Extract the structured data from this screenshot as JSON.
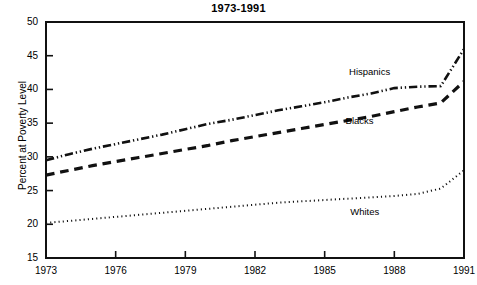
{
  "chart_data": {
    "type": "line",
    "title": "1973-1991",
    "xlabel": "",
    "ylabel": "Percent at Poverty Level",
    "xlim": [
      1973,
      1991
    ],
    "ylim": [
      15,
      50
    ],
    "ytick_step": 5,
    "xtick_step": 3,
    "grid": false,
    "legend_position": "inline-annotations",
    "xticks": [
      "1973",
      "1976",
      "1979",
      "1982",
      "1985",
      "1988",
      "1991"
    ],
    "yticks": [
      "15",
      "20",
      "25",
      "30",
      "35",
      "40",
      "45",
      "50"
    ],
    "x": [
      1973,
      1974,
      1975,
      1976,
      1977,
      1978,
      1979,
      1980,
      1981,
      1982,
      1983,
      1984,
      1985,
      1986,
      1987,
      1988,
      1989,
      1990,
      1991
    ],
    "series": [
      {
        "name": "Hispanics",
        "line_style": "dash-dot-dot",
        "color": "#111111",
        "width": 2.6,
        "label_x": 1986.05,
        "label_y": 42.6,
        "values": [
          29.5,
          30.4,
          31.2,
          31.9,
          32.6,
          33.3,
          34.1,
          34.9,
          35.5,
          36.2,
          36.9,
          37.5,
          38.1,
          38.8,
          39.4,
          40.2,
          40.4,
          40.5,
          46.0
        ]
      },
      {
        "name": "Blacks",
        "line_style": "dash",
        "color": "#111111",
        "width": 3.2,
        "label_x": 1985.9,
        "label_y": 35.3,
        "values": [
          27.3,
          28.0,
          28.7,
          29.3,
          29.9,
          30.5,
          31.1,
          31.7,
          32.4,
          33.0,
          33.6,
          34.2,
          34.8,
          35.4,
          36.0,
          36.7,
          37.4,
          38.0,
          41.2
        ]
      },
      {
        "name": "Whites",
        "line_style": "dot",
        "color": "#111111",
        "width": 2.0,
        "label_x": 1986.1,
        "label_y": 21.8,
        "values": [
          20.2,
          20.5,
          20.8,
          21.1,
          21.4,
          21.7,
          22.0,
          22.3,
          22.6,
          22.9,
          23.2,
          23.4,
          23.6,
          23.8,
          24.0,
          24.2,
          24.5,
          25.3,
          28.0
        ]
      }
    ]
  }
}
